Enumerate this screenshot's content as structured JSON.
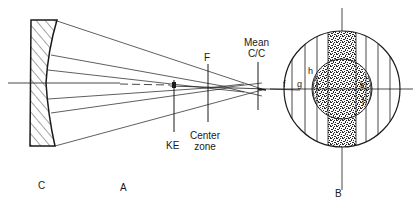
{
  "diagram": {
    "type": "optics-schematic",
    "labels": {
      "mirror": "C",
      "section_a": "A",
      "section_b": "B",
      "knife_edge": "KE",
      "focus": "F",
      "center_zone_line1": "Center",
      "center_zone_line2": "zone",
      "mean_cc_line1": "Mean",
      "mean_cc_line2": "C/C",
      "zones": [
        "f",
        "g",
        "h",
        "i",
        "j",
        "k"
      ]
    },
    "colors": {
      "ink": "#1a1a1a",
      "background": "#ffffff",
      "stipple": "#2a2a2a"
    }
  }
}
